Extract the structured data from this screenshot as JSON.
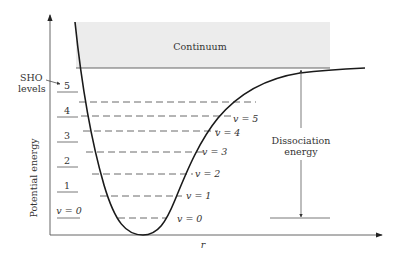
{
  "figure": {
    "type": "Morse potential energy diagram",
    "y_axis_label": "Potential energy",
    "x_axis_label": "r",
    "continuum_label": "Continuum",
    "sho_label_line1": "SHO",
    "sho_label_line2": "levels",
    "dissociation_label_line1": "Dissociation",
    "dissociation_label_line2": "energy",
    "colors": {
      "curve": "#1a1a1a",
      "axes": "#555555",
      "continuum_fill": "#ececec",
      "dashes": "#444444",
      "text": "#333333"
    },
    "sho_levels": [
      {
        "label": "v = 0",
        "y": 216
      },
      {
        "label": "1",
        "y": 191
      },
      {
        "label": "2",
        "y": 166
      },
      {
        "label": "3",
        "y": 141
      },
      {
        "label": "4",
        "y": 116
      },
      {
        "label": "5",
        "y": 91
      }
    ],
    "morse_levels": [
      {
        "label": "v = 0",
        "y": 218,
        "x1": 118,
        "x2": 168
      },
      {
        "label": "v = 1",
        "y": 195,
        "x1": 100,
        "x2": 183
      },
      {
        "label": "v = 2",
        "y": 173,
        "x1": 92,
        "x2": 194
      },
      {
        "label": "v = 3",
        "y": 151,
        "x1": 86,
        "x2": 206
      },
      {
        "label": "v = 4",
        "y": 131,
        "x1": 82,
        "x2": 220
      },
      {
        "label": "v = 5",
        "y": 116,
        "x1": 80,
        "x2": 237
      },
      {
        "label": "",
        "y": 101,
        "x1": 78,
        "x2": 258
      }
    ]
  }
}
